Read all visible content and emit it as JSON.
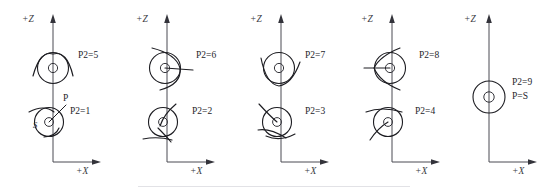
{
  "figure": {
    "background_color": "#ffffff",
    "line_color": "#1d1d22",
    "axis_color": "#4a4a52"
  },
  "axes": {
    "vertical_label": "+Z",
    "horizontal_label": "+X"
  },
  "panels": [
    {
      "id": "panel-1",
      "axis_z_label": "+Z",
      "axis_x_label": "+X",
      "glyphs": [
        {
          "id": "glyph-p2-5",
          "p2_label": "P2=5",
          "p2_value": 5,
          "position": "upper"
        },
        {
          "id": "glyph-p2-1",
          "p2_label": "P2=1",
          "p2_value": 1,
          "position": "lower",
          "point_label": "P",
          "source_label": "S"
        }
      ]
    },
    {
      "id": "panel-2",
      "axis_z_label": "+Z",
      "axis_x_label": "+X",
      "glyphs": [
        {
          "id": "glyph-p2-6",
          "p2_label": "P2=6",
          "p2_value": 6,
          "position": "upper"
        },
        {
          "id": "glyph-p2-2",
          "p2_label": "P2=2",
          "p2_value": 2,
          "position": "lower"
        }
      ]
    },
    {
      "id": "panel-3",
      "axis_z_label": "+Z",
      "axis_x_label": "+X",
      "glyphs": [
        {
          "id": "glyph-p2-7",
          "p2_label": "P2=7",
          "p2_value": 7,
          "position": "upper"
        },
        {
          "id": "glyph-p2-3",
          "p2_label": "P2=3",
          "p2_value": 3,
          "position": "lower"
        }
      ]
    },
    {
      "id": "panel-4",
      "axis_z_label": "+Z",
      "axis_x_label": "+X",
      "glyphs": [
        {
          "id": "glyph-p2-8",
          "p2_label": "P2=8",
          "p2_value": 8,
          "position": "upper"
        },
        {
          "id": "glyph-p2-4",
          "p2_label": "P2=4",
          "p2_value": 4,
          "position": "lower"
        }
      ]
    },
    {
      "id": "panel-5",
      "axis_z_label": "+Z",
      "axis_x_label": "+X",
      "glyphs": [
        {
          "id": "glyph-p2-9",
          "p2_label": "P2=9",
          "p2_value": 9,
          "position": "middle",
          "identity_label": "P=S"
        }
      ]
    }
  ],
  "labels": {
    "p2_5": "P2=5",
    "p2_1": "P2=1",
    "p2_6": "P2=6",
    "p2_2": "P2=2",
    "p2_7": "P2=7",
    "p2_3": "P2=3",
    "p2_8": "P2=8",
    "p2_4": "P2=4",
    "p2_9": "P2=9",
    "p_point": "P",
    "s_point": "S",
    "p_equals_s": "P=S",
    "axis_z": "+Z",
    "axis_x": "+X"
  }
}
